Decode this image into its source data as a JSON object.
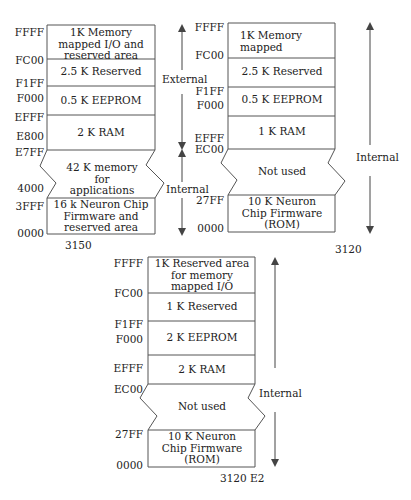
{
  "diagrams": [
    {
      "caption": "3150",
      "addresses": [
        "FFFF",
        "FC00",
        "F1FF",
        "F000",
        "EFFF",
        "E800",
        "E7FF",
        "4000",
        "3FFF",
        "0000"
      ],
      "segments": [
        "1K  Memory mapped I/O and reserved area",
        "2.5 K Reserved",
        "0.5 K EEPROM",
        "2 K RAM",
        "42 K memory for applications",
        "16 k Neuron Chip Firmware and reserved area"
      ],
      "side_labels": [
        "External",
        "Internal"
      ]
    },
    {
      "caption": "3120",
      "addresses": [
        "FFFF",
        "FC00",
        "F1FF",
        "F000",
        "EFFF",
        "EC00",
        "27FF",
        "0000"
      ],
      "segments": [
        "1K Memory mapped",
        "2.5 K Reserved",
        "0.5 K EEPROM",
        "1 K RAM",
        "Not used",
        "10 K Neuron Chip Firmware (ROM)"
      ],
      "side_labels": [
        "Internal"
      ]
    },
    {
      "caption": "3120 E2",
      "addresses": [
        "FFFF",
        "FC00",
        "F1FF",
        "F000",
        "EFFF",
        "EC00",
        "27FF",
        "0000"
      ],
      "segments": [
        "1K Reserved area for memory mapped I/O",
        "1 K Reserved",
        "2 K EEPROM",
        "2 K RAM",
        "Not used",
        "10 K Neuron Chip Firmware (ROM)"
      ],
      "side_labels": [
        "Internal"
      ]
    }
  ],
  "colors": {
    "line": "#555555",
    "text": "#222222",
    "background": "#ffffff"
  }
}
